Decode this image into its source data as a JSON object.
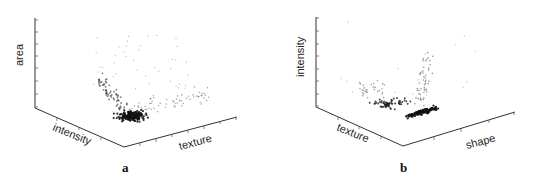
{
  "figure": {
    "panels": [
      {
        "label": "a"
      },
      {
        "label": "b"
      }
    ]
  },
  "chart_data": [
    {
      "type": "scatter",
      "projection": "3d",
      "title": "",
      "panel_label": "a",
      "zlabel": "area",
      "xlabel": "intensity",
      "ylabel": "texture",
      "grid": false,
      "legend": null,
      "description": "Dense cluster near low area, mid intensity/texture; sparse points spreading upward along area axis and outward along texture.",
      "cluster_center_px": [
        130,
        115
      ]
    },
    {
      "type": "scatter",
      "projection": "3d",
      "title": "",
      "panel_label": "b",
      "zlabel": "intensity",
      "xlabel": "texture",
      "ylabel": "shape",
      "grid": false,
      "legend": null,
      "description": "Tight dense cluster at low intensity near texture/shape corner; sparse points rising in a V-shape upward along intensity.",
      "cluster_center_px": [
        415,
        113
      ]
    }
  ]
}
